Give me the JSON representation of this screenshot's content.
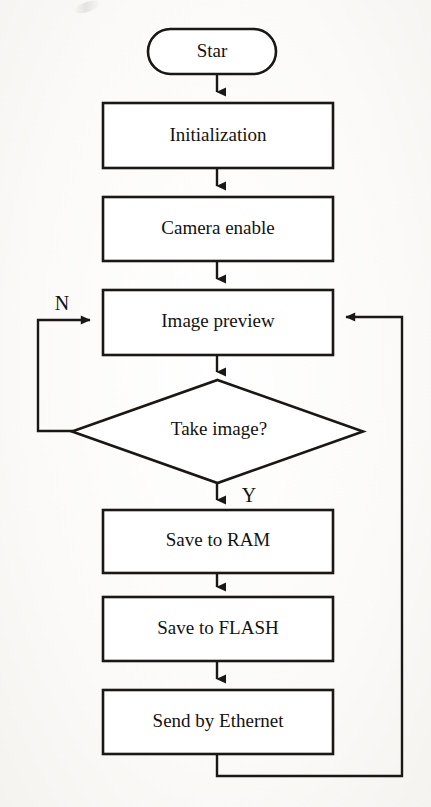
{
  "diagram": {
    "type": "flowchart",
    "orientation": "top-to-bottom",
    "colors": {
      "stroke": "#1a1714",
      "fill": "#ffffff",
      "text": "#14120f",
      "background": "#fbfaf8"
    },
    "nodes": [
      {
        "id": "start",
        "shape": "rounded-terminal",
        "label": "Star",
        "font_size": 19,
        "box": {
          "x": 148,
          "y": 29,
          "w": 128,
          "h": 45
        }
      },
      {
        "id": "initialization",
        "shape": "process",
        "label": "Initialization",
        "font_size": 19,
        "box": {
          "x": 103,
          "y": 103,
          "w": 230,
          "h": 65
        }
      },
      {
        "id": "camera-enable",
        "shape": "process",
        "label": "Camera enable",
        "font_size": 19,
        "box": {
          "x": 103,
          "y": 197,
          "w": 230,
          "h": 64
        }
      },
      {
        "id": "image-preview",
        "shape": "process",
        "label": "Image preview",
        "font_size": 19,
        "box": {
          "x": 103,
          "y": 290,
          "w": 230,
          "h": 65
        }
      },
      {
        "id": "take-image",
        "shape": "decision",
        "label": "Take image?",
        "font_size": 19,
        "box": {
          "x": 72,
          "y": 380,
          "w": 291,
          "h": 103
        }
      },
      {
        "id": "save-to-ram",
        "shape": "process",
        "label": "Save to RAM",
        "font_size": 19,
        "box": {
          "x": 103,
          "y": 510,
          "w": 230,
          "h": 63
        }
      },
      {
        "id": "save-to-flash",
        "shape": "process",
        "label": "Save to FLASH",
        "font_size": 19,
        "box": {
          "x": 103,
          "y": 597,
          "w": 230,
          "h": 64
        }
      },
      {
        "id": "send-by-ethernet",
        "shape": "process",
        "label": "Send by Ethernet",
        "font_size": 19,
        "box": {
          "x": 103,
          "y": 690,
          "w": 230,
          "h": 64
        }
      }
    ],
    "edge_labels": [
      {
        "id": "no-branch-label",
        "text": "N",
        "x": 62,
        "y": 305,
        "font_size": 20
      },
      {
        "id": "yes-branch-label",
        "text": "Y",
        "x": 249,
        "y": 497,
        "font_size": 20
      }
    ],
    "edges": [
      {
        "id": "start-to-initialization",
        "from": "start",
        "to": "initialization",
        "kind": "straight-down",
        "arrow": true
      },
      {
        "id": "initialization-to-camera-enable",
        "from": "initialization",
        "to": "camera-enable",
        "kind": "straight-down",
        "arrow": true
      },
      {
        "id": "camera-enable-to-image-preview",
        "from": "camera-enable",
        "to": "image-preview",
        "kind": "straight-down",
        "arrow": true
      },
      {
        "id": "image-preview-to-take-image",
        "from": "image-preview",
        "to": "take-image",
        "kind": "straight-down",
        "arrow": true
      },
      {
        "id": "take-image-no-loop",
        "from": "take-image",
        "to": "image-preview",
        "kind": "left-feedback",
        "label": "N",
        "arrow": true
      },
      {
        "id": "take-image-yes-to-save-to-ram",
        "from": "take-image",
        "to": "save-to-ram",
        "kind": "straight-down",
        "label": "Y",
        "arrow": true
      },
      {
        "id": "save-to-ram-to-save-to-flash",
        "from": "save-to-ram",
        "to": "save-to-flash",
        "kind": "straight-down",
        "arrow": true
      },
      {
        "id": "save-to-flash-to-send-by-ethernet",
        "from": "save-to-flash",
        "to": "send-by-ethernet",
        "kind": "straight-down",
        "arrow": true
      },
      {
        "id": "send-by-ethernet-to-image-preview",
        "from": "send-by-ethernet",
        "to": "image-preview",
        "kind": "right-feedback",
        "arrow": true
      }
    ]
  }
}
